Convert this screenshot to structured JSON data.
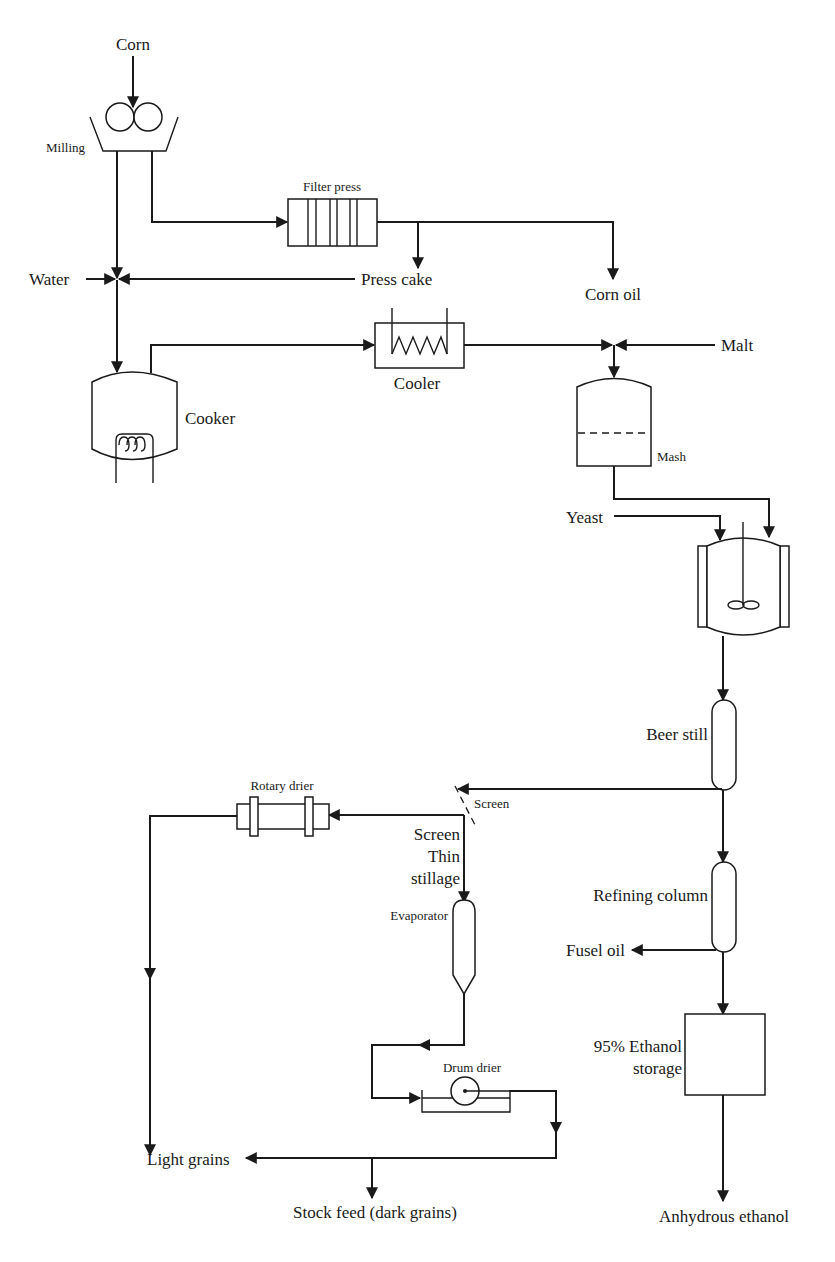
{
  "diagram": {
    "type": "process-flow",
    "colors": {
      "line": "#1a1a1a",
      "background": "#ffffff"
    },
    "labels": {
      "corn": "Corn",
      "milling": "Milling",
      "filter_press": "Filter press",
      "water": "Water",
      "press_cake": "Press cake",
      "corn_oil": "Corn oil",
      "cooker": "Cooker",
      "cooler": "Cooler",
      "malt": "Malt",
      "mash": "Mash",
      "yeast": "Yeast",
      "beer_still": "Beer still",
      "rotary_drier": "Rotary drier",
      "screen_top": "Screen",
      "screen": "Screen",
      "thin": "Thin",
      "stillage": "stillage",
      "evaporator": "Evaporator",
      "refining_column": "Refining column",
      "fusel_oil": "Fusel oil",
      "drum_drier": "Drum drier",
      "ethanol_storage_1": "95% Ethanol",
      "ethanol_storage_2": "storage",
      "light_grains": "Light grains",
      "stock_feed": "Stock feed (dark grains)",
      "anhydrous_ethanol": "Anhydrous ethanol"
    },
    "nodes": [
      {
        "id": "milling",
        "label": "Milling",
        "shape": "hopper-with-rollers"
      },
      {
        "id": "filter_press",
        "label": "Filter press",
        "shape": "plate-frame"
      },
      {
        "id": "cooker",
        "label": "Cooker",
        "shape": "vessel-with-coil"
      },
      {
        "id": "cooler",
        "label": "Cooler",
        "shape": "box-with-coil"
      },
      {
        "id": "mash",
        "label": "Mash",
        "shape": "vessel-with-level"
      },
      {
        "id": "fermenter",
        "label": "",
        "shape": "jacketed-agitated-vessel"
      },
      {
        "id": "beer_still",
        "label": "Beer still",
        "shape": "column"
      },
      {
        "id": "screen",
        "label": "Screen",
        "shape": "dashed-screen"
      },
      {
        "id": "rotary_drier",
        "label": "Rotary drier",
        "shape": "drum"
      },
      {
        "id": "evaporator",
        "label": "Evaporator",
        "shape": "column-conical"
      },
      {
        "id": "drum_drier",
        "label": "Drum drier",
        "shape": "drum-with-tray"
      },
      {
        "id": "refining_column",
        "label": "Refining column",
        "shape": "column"
      },
      {
        "id": "ethanol_storage",
        "label": "95% Ethanol storage",
        "shape": "box"
      }
    ],
    "edges": [
      {
        "from": "Corn",
        "to": "milling"
      },
      {
        "from": "milling",
        "to": "filter_press"
      },
      {
        "from": "milling",
        "to": "cooker"
      },
      {
        "from": "filter_press",
        "to": "Press cake"
      },
      {
        "from": "filter_press",
        "to": "Corn oil"
      },
      {
        "from": "Press cake",
        "to": "cooker"
      },
      {
        "from": "Water",
        "to": "cooker"
      },
      {
        "from": "cooker",
        "to": "cooler"
      },
      {
        "from": "cooler",
        "to": "mash"
      },
      {
        "from": "Malt",
        "to": "mash"
      },
      {
        "from": "mash",
        "to": "fermenter"
      },
      {
        "from": "Yeast",
        "to": "fermenter"
      },
      {
        "from": "fermenter",
        "to": "beer_still"
      },
      {
        "from": "beer_still",
        "to": "screen"
      },
      {
        "from": "beer_still",
        "to": "refining_column"
      },
      {
        "from": "screen",
        "to": "rotary_drier"
      },
      {
        "from": "screen",
        "to": "evaporator",
        "label": "Thin stillage"
      },
      {
        "from": "rotary_drier",
        "to": "Light grains"
      },
      {
        "from": "evaporator",
        "to": "drum_drier"
      },
      {
        "from": "drum_drier",
        "to": "Light grains"
      },
      {
        "from": "drum_drier",
        "to": "Stock feed (dark grains)"
      },
      {
        "from": "refining_column",
        "to": "Fusel oil"
      },
      {
        "from": "refining_column",
        "to": "ethanol_storage"
      },
      {
        "from": "ethanol_storage",
        "to": "Anhydrous ethanol"
      }
    ]
  }
}
